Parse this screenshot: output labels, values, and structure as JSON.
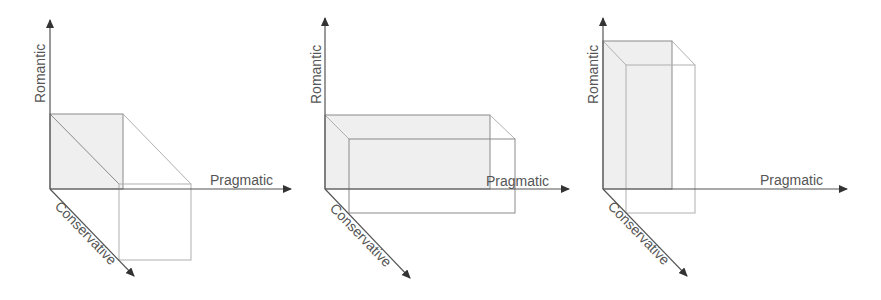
{
  "axes": {
    "y_label": "Romantic",
    "x_label": "Pragmatic",
    "z_label": "Conservative"
  },
  "colors": {
    "axis": "#555555",
    "box_line": "#8a8a8a",
    "shade": "#efefef",
    "label": "#555555"
  },
  "diagrams": [
    {
      "id": "diagram-1",
      "description": "Cube: equal romantic height, conservative depth offset"
    },
    {
      "id": "diagram-2",
      "description": "Wide box: high pragmatic extent"
    },
    {
      "id": "diagram-3",
      "description": "Tall box: high romantic extent"
    }
  ]
}
